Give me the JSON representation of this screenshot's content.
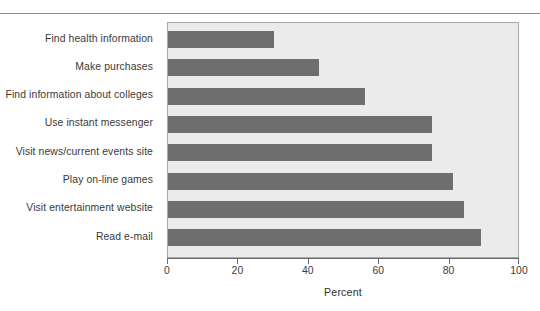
{
  "chart_data": {
    "type": "bar",
    "orientation": "horizontal",
    "title": "",
    "xlabel": "Percent",
    "ylabel": "",
    "xlim": [
      0,
      100
    ],
    "xticks": [
      "0",
      "20",
      "40",
      "60",
      "80",
      "100"
    ],
    "grid": false,
    "legend": null,
    "categories": [
      "Find health information",
      "Make purchases",
      "Find information about colleges",
      "Use instant messenger",
      "Visit news/current events site",
      "Play on-line games",
      "Visit entertainment website",
      "Read e-mail"
    ],
    "values": [
      30,
      43,
      56,
      75,
      75,
      81,
      84,
      89
    ],
    "colors": {
      "bar": "#6e6e6e",
      "plot_background": "#ebebeb",
      "axis": "#6b6b6b",
      "text": "#3a3a3a"
    }
  }
}
